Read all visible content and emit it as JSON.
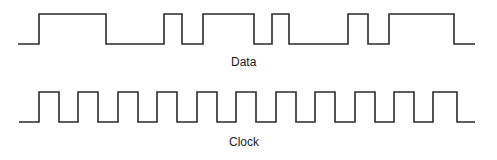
{
  "diagram": {
    "title": "",
    "labels": {
      "data": "Data",
      "clock": "Clock"
    },
    "colors": {
      "background": "#ffffff",
      "stroke": "#2a2a2a",
      "text": "#1a1a1a"
    },
    "signals": {
      "data": {
        "name": "Data",
        "high_y": 14,
        "low_y": 44,
        "start_x": 18,
        "end_x": 475,
        "initial_level": 0,
        "transitions_x": [
          39,
          106,
          164,
          182,
          203,
          254,
          272,
          289,
          348,
          368,
          389,
          454
        ]
      },
      "clock": {
        "name": "Clock",
        "high_y": 92,
        "low_y": 122,
        "start_x": 19,
        "end_x": 475,
        "initial_level": 0,
        "transitions_x": [
          39,
          59,
          78,
          98,
          118,
          138,
          157,
          177,
          197,
          217,
          236,
          256,
          276,
          296,
          315,
          335,
          355,
          375,
          394,
          414,
          433,
          457
        ]
      }
    }
  }
}
